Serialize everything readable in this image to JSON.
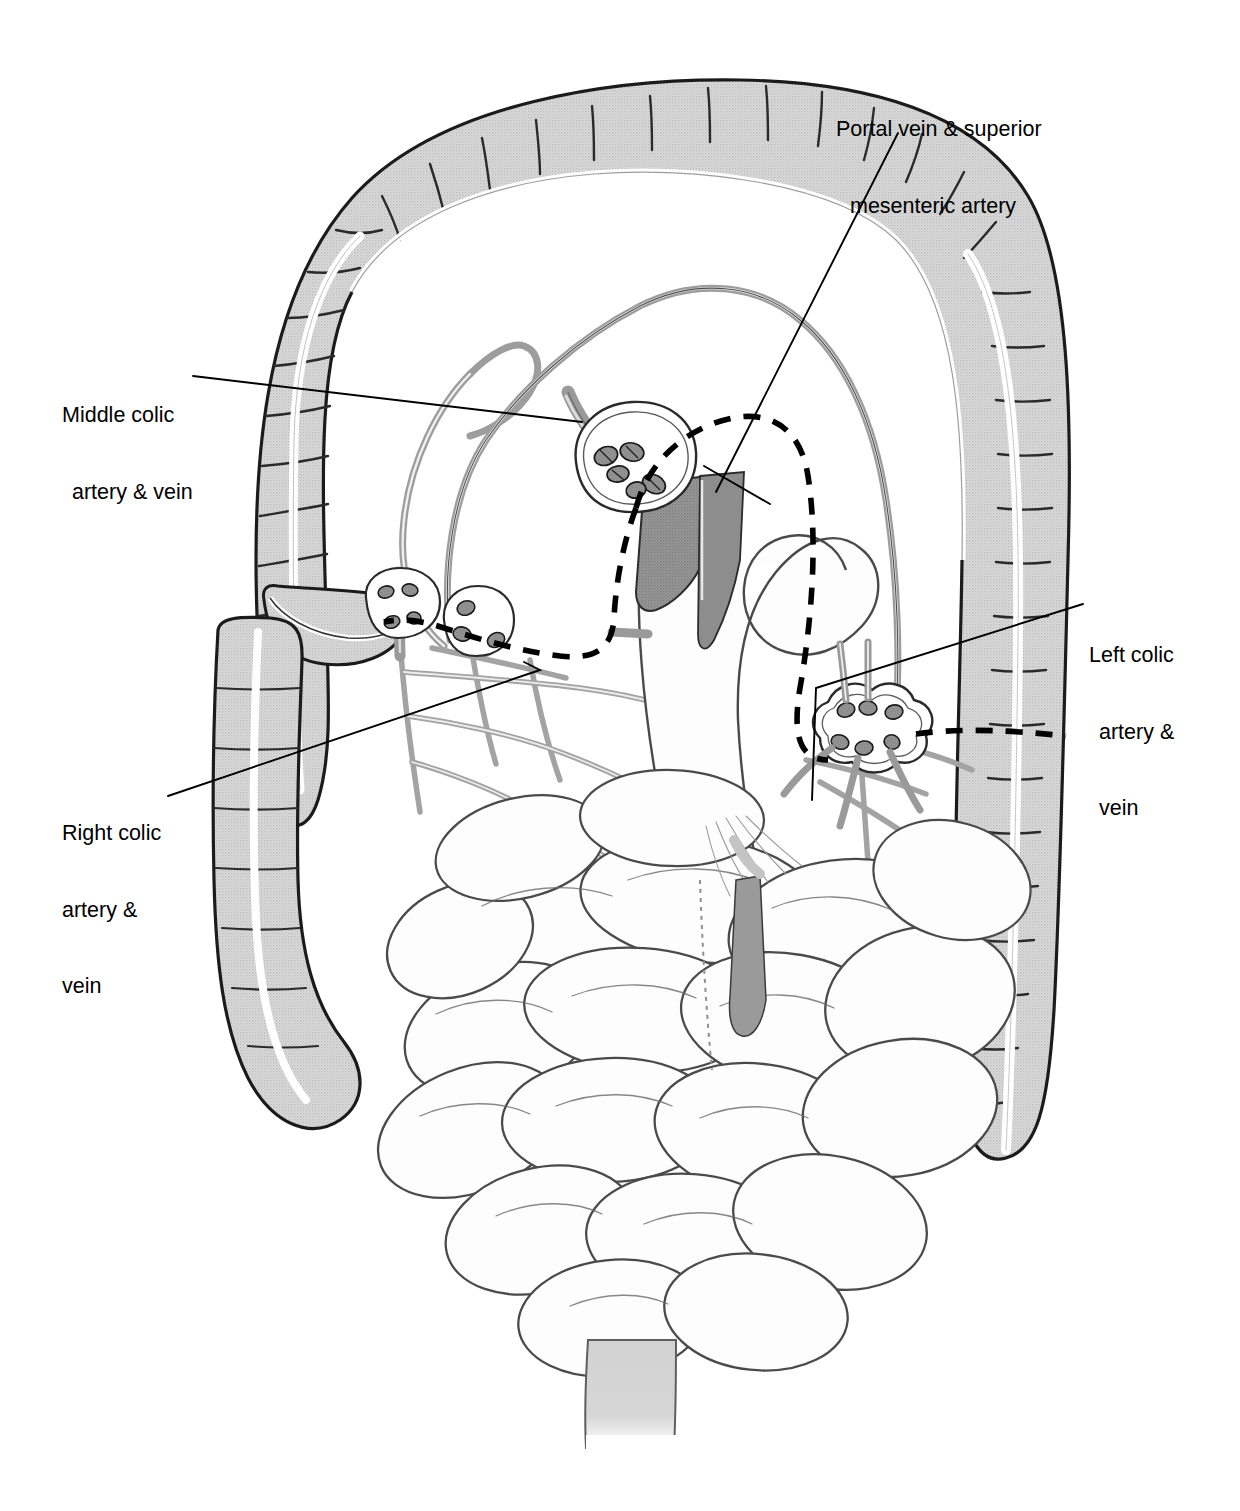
{
  "figure": {
    "background_color": "#ffffff"
  },
  "palette": {
    "ink": "#111111",
    "colon_fill": "#d6d6d6",
    "colon_outline": "#1a1a1a",
    "vessel_light": "#b4b4b4",
    "vessel_dark": "#8a8a8a",
    "trunk_dark": "#8e8e8e",
    "bowel_outline": "#4a4a4a",
    "bowel_fill": "#fefefe",
    "rectum_fill": "#d0d0d0",
    "dashed_line": "#000000",
    "leader_line": "#000000"
  },
  "labels": [
    {
      "id": "portal",
      "name": "portal-vein-sma-label",
      "lines": [
        "Portal vein & superior",
        "mesenteric artery"
      ],
      "align": "center"
    },
    {
      "id": "middle",
      "name": "middle-colic-label",
      "lines": [
        "Middle colic",
        "artery & vein"
      ],
      "align": "left"
    },
    {
      "id": "right",
      "name": "right-colic-label",
      "lines": [
        "Right colic",
        "artery &",
        "vein"
      ],
      "align": "left"
    },
    {
      "id": "left",
      "name": "left-colic-label",
      "lines": [
        "Left colic",
        "artery &",
        "vein"
      ],
      "align": "left"
    }
  ],
  "leader_lines": [
    {
      "name": "leader-portal",
      "from": [
        898,
        133
      ],
      "to": [
        716,
        492
      ]
    },
    {
      "name": "leader-portal-b",
      "from": [
        770,
        500
      ],
      "to": [
        706,
        468
      ]
    },
    {
      "name": "leader-middle",
      "from": [
        193,
        376
      ],
      "to": [
        582,
        422
      ]
    },
    {
      "name": "leader-right",
      "from": [
        170,
        795
      ],
      "to": [
        540,
        672
      ]
    },
    {
      "name": "leader-left",
      "from": [
        1083,
        604
      ],
      "to": [
        812,
        692
      ]
    }
  ],
  "anatomy": {
    "structures": [
      "transverse colon",
      "ascending colon",
      "hepatic flexure",
      "splenic flexure",
      "descending colon",
      "cecum",
      "appendix",
      "small bowel loops",
      "rectum",
      "marginal artery arcade",
      "mesenteric lymph nodes",
      "superior mesenteric vessel trunk",
      "dashed resection boundary"
    ],
    "node_clusters": [
      {
        "name": "middle-colic-nodes",
        "cx": 622,
        "cy": 466,
        "count": 4
      },
      {
        "name": "right-colic-nodes",
        "cx": 474,
        "cy": 628,
        "count": 3
      },
      {
        "name": "ileocolic-nodes",
        "cx": 398,
        "cy": 612,
        "count": 3
      },
      {
        "name": "left-colic-nodes",
        "cx": 872,
        "cy": 732,
        "count": 6
      }
    ]
  }
}
